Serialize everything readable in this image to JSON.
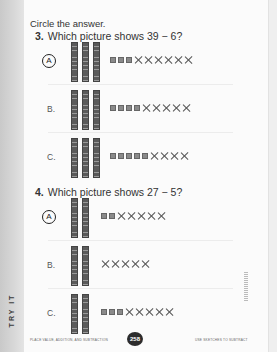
{
  "instruction": "Circle the answer.",
  "side_tab": "TRY IT",
  "questions": [
    {
      "number": "3.",
      "prompt": "Which picture shows 39 − 6?",
      "options": [
        {
          "label": "A",
          "circled": true,
          "tens": 3,
          "remaining_ones": 3,
          "crossed_ones": 6
        },
        {
          "label": "B.",
          "circled": false,
          "tens": 3,
          "remaining_ones": 4,
          "crossed_ones": 5
        },
        {
          "label": "C.",
          "circled": false,
          "tens": 3,
          "remaining_ones": 5,
          "crossed_ones": 4
        }
      ]
    },
    {
      "number": "4.",
      "prompt": "Which picture shows 27 − 5?",
      "options": [
        {
          "label": "A",
          "circled": true,
          "tens": 2,
          "remaining_ones": 2,
          "crossed_ones": 5
        },
        {
          "label": "B.",
          "circled": false,
          "tens": 2,
          "remaining_ones": 0,
          "crossed_ones": 5
        },
        {
          "label": "C.",
          "circled": false,
          "tens": 2,
          "remaining_ones": 3,
          "crossed_ones": 5
        }
      ]
    }
  ],
  "footer": {
    "left": "PLACE VALUE, ADDITION, AND SUBTRACTION",
    "page_number": "258",
    "right": "USE SKETCHES TO SUBTRACT"
  }
}
